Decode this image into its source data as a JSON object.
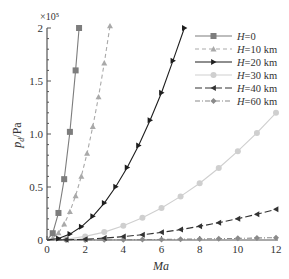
{
  "chart_data": {
    "type": "line",
    "title": "",
    "xlabel": "Ma",
    "ylabel": "p_d / Pa",
    "ylabel_main": "p",
    "ylabel_sub": "d",
    "ylabel_unit": "/Pa",
    "y_multiplier": "×10⁵",
    "xlim": [
      0,
      12
    ],
    "ylim": [
      0,
      2
    ],
    "x_ticks": [
      0,
      2,
      4,
      6,
      8,
      10,
      12
    ],
    "x_tick_labels": [
      "0",
      "2",
      "4",
      "6",
      "8",
      "10",
      "12"
    ],
    "y_ticks": [
      0,
      0.5,
      1.0,
      1.5,
      2
    ],
    "y_tick_labels": [
      "0",
      "0.5",
      "1.0",
      "1.5",
      "2"
    ],
    "grid": false,
    "legend_position": "upper right",
    "series": [
      {
        "name": "H=0",
        "label_var": "H",
        "label_rest": "=0",
        "color": "#7d7d7d",
        "marker": "square",
        "dash": "",
        "x": [
          0.3,
          0.6,
          0.9,
          1.2,
          1.5,
          1.68
        ],
        "values": [
          0.064,
          0.255,
          0.574,
          1.02,
          1.6,
          2.0
        ]
      },
      {
        "name": "H=10 km",
        "label_var": "H",
        "label_rest": "=10 km",
        "color": "#a9a9a9",
        "marker": "triangle-up",
        "dash": "4,3",
        "x": [
          0.3,
          0.6,
          0.9,
          1.2,
          1.5,
          1.8,
          2.1,
          2.4,
          2.7,
          3.0,
          3.3
        ],
        "values": [
          0.017,
          0.067,
          0.15,
          0.267,
          0.417,
          0.601,
          0.818,
          1.07,
          1.35,
          1.67,
          2.02
        ]
      },
      {
        "name": "H=20 km",
        "label_var": "H",
        "label_rest": "=20 km",
        "color": "#1e1e1e",
        "marker": "triangle-right",
        "dash": "",
        "x": [
          0.6,
          1.2,
          1.8,
          2.4,
          3.0,
          3.6,
          4.2,
          4.8,
          5.4,
          6.0,
          6.6,
          7.2
        ],
        "values": [
          0.014,
          0.056,
          0.125,
          0.223,
          0.348,
          0.502,
          0.683,
          0.892,
          1.13,
          1.39,
          1.69,
          2.0
        ]
      },
      {
        "name": "H=30 km",
        "label_var": "H",
        "label_rest": "=30 km",
        "color": "#cfcfcf",
        "marker": "circle",
        "dash": "",
        "x": [
          1,
          2,
          3,
          4,
          5,
          6,
          7,
          8,
          9,
          10,
          11,
          12
        ],
        "values": [
          0.008,
          0.034,
          0.075,
          0.134,
          0.21,
          0.302,
          0.411,
          0.536,
          0.679,
          0.838,
          1.01,
          1.2
        ]
      },
      {
        "name": "H=40 km",
        "label_var": "H",
        "label_rest": "=40 km",
        "color": "#333333",
        "marker": "triangle-left",
        "dash": "7,3",
        "x": [
          1,
          2,
          3,
          4,
          5,
          6,
          7,
          8,
          9,
          10,
          11,
          12
        ],
        "values": [
          0.002,
          0.008,
          0.018,
          0.032,
          0.05,
          0.072,
          0.098,
          0.129,
          0.163,
          0.201,
          0.243,
          0.289
        ]
      },
      {
        "name": "H=60 km",
        "label_var": "H",
        "label_rest": "=60 km",
        "color": "#8a8a8a",
        "marker": "diamond",
        "dash": "5,2,1,2",
        "x": [
          1,
          2,
          3,
          4,
          5,
          6,
          7,
          8,
          9,
          10,
          11,
          12
        ],
        "values": [
          0.0002,
          0.0006,
          0.0014,
          0.0025,
          0.0039,
          0.0055,
          0.0075,
          0.0099,
          0.0125,
          0.0154,
          0.0186,
          0.0222
        ]
      }
    ]
  }
}
